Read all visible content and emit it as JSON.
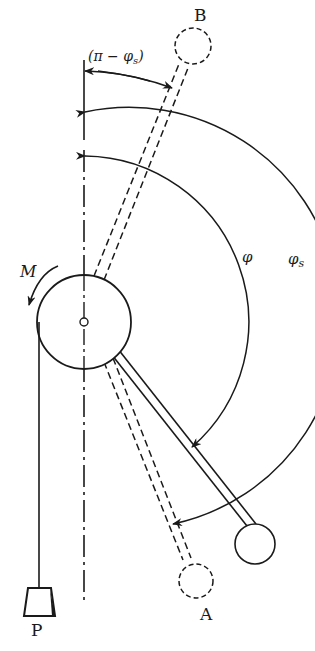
{
  "diagram": {
    "type": "mechanics-pendulum-pulley",
    "colors": {
      "ink": "#1a1a1a",
      "background": "#ffffff"
    },
    "labels": {
      "top_bob": "B",
      "bottom_bob": "A",
      "weight": "P",
      "moment": "M",
      "angle_phi": "φ",
      "angle_phi_s": "φ",
      "angle_phi_s_sub": "s",
      "angle_complement": "(π − φ",
      "angle_complement_sub": "s",
      "angle_complement_close": ")"
    },
    "elements": [
      {
        "id": "pivot-disc",
        "shape": "circle"
      },
      {
        "id": "vertical-axis",
        "style": "dash-dot"
      },
      {
        "id": "rod-current",
        "style": "solid",
        "to": "bob-current"
      },
      {
        "id": "rod-B",
        "style": "dashed",
        "to": "bob-B"
      },
      {
        "id": "rod-A",
        "style": "dashed",
        "to": "bob-A"
      },
      {
        "id": "weight-P",
        "shape": "trapezoid"
      },
      {
        "id": "arc-complement",
        "label": "(π − φs)"
      },
      {
        "id": "arc-phi",
        "label": "φ"
      },
      {
        "id": "arc-phi-s",
        "label": "φs"
      },
      {
        "id": "moment-arrow",
        "label": "M"
      }
    ]
  }
}
